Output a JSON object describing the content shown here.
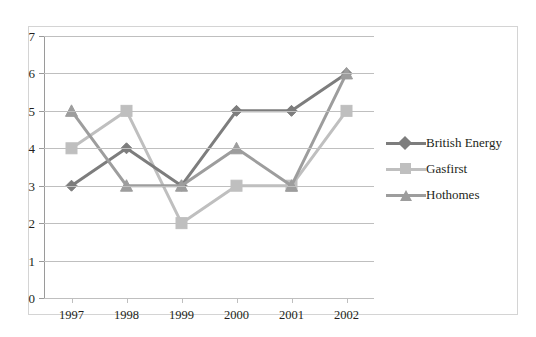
{
  "chart_data": {
    "type": "line",
    "title": "",
    "xlabel": "",
    "ylabel": "",
    "categories": [
      "1997",
      "1998",
      "1999",
      "2000",
      "2001",
      "2002"
    ],
    "ylim": [
      0,
      7
    ],
    "y_ticks": [
      "0",
      "1",
      "2",
      "3",
      "4",
      "5",
      "6",
      "7"
    ],
    "grid": true,
    "legend_position": "right",
    "series": [
      {
        "name": "British Energy",
        "color": "#7d7d7d",
        "marker": "diamond",
        "values": [
          3,
          4,
          3,
          5,
          5,
          6
        ]
      },
      {
        "name": "Gasfirst",
        "color": "#bfbfbf",
        "marker": "square",
        "values": [
          4,
          5,
          2,
          3,
          3,
          5
        ]
      },
      {
        "name": "Hothomes",
        "color": "#9d9d9d",
        "marker": "triangle",
        "values": [
          5,
          3,
          3,
          4,
          3,
          6
        ]
      }
    ]
  },
  "legend": {
    "items": [
      {
        "label": "British Energy"
      },
      {
        "label": "Gasfirst"
      },
      {
        "label": "Hothomes"
      }
    ]
  },
  "axes": {
    "y_ticks": [
      "7",
      "6",
      "5",
      "4",
      "3",
      "2",
      "1",
      "0"
    ],
    "x_ticks": [
      "1997",
      "1998",
      "1999",
      "2000",
      "2001",
      "2002"
    ]
  },
  "top_clipped_text": "  "
}
